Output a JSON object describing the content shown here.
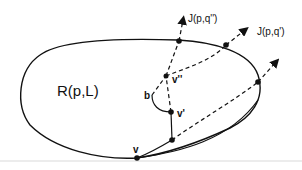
{
  "figure": {
    "region_label": "R(p,L)",
    "ray_labels": {
      "upper": "J(p,q'')",
      "right": "J(p,q')"
    },
    "vertex_labels": {
      "v": "v",
      "v_prime": "v'",
      "v_double_prime": "v''",
      "b": "b"
    },
    "colors": {
      "stroke": "#111111",
      "background": "#ffffff",
      "baseline": "#ececec"
    }
  }
}
